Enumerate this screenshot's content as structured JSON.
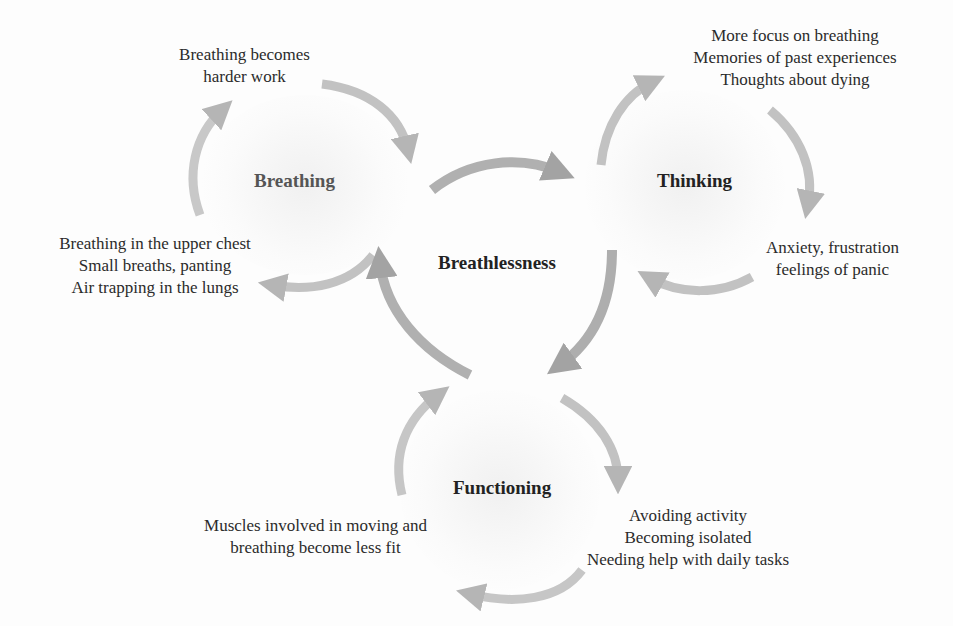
{
  "diagram": {
    "center": {
      "label": "Breathlessness"
    },
    "nodes": [
      {
        "id": "breathing",
        "label": "Breathing",
        "annotations": [
          {
            "lines": [
              "Breathing becomes",
              "harder work"
            ]
          },
          {
            "lines": [
              "Breathing in the upper chest",
              "Small breaths, panting",
              "Air trapping in the lungs"
            ]
          }
        ]
      },
      {
        "id": "thinking",
        "label": "Thinking",
        "annotations": [
          {
            "lines": [
              "More focus on breathing",
              "Memories of past experiences",
              "Thoughts about dying"
            ]
          },
          {
            "lines": [
              "Anxiety, frustration",
              "feelings of panic"
            ]
          }
        ]
      },
      {
        "id": "functioning",
        "label": "Functioning",
        "annotations": [
          {
            "lines": [
              "Avoiding activity",
              "Becoming isolated",
              "Needing help with daily tasks"
            ]
          },
          {
            "lines": [
              "Muscles involved in moving and",
              "breathing become less fit"
            ]
          }
        ]
      }
    ],
    "edges": [
      {
        "from": "breathlessness",
        "to": "thinking"
      },
      {
        "from": "breathlessness",
        "to": "functioning"
      },
      {
        "from": "functioning",
        "to": "breathlessness"
      }
    ],
    "colors": {
      "arrow": "#b9b9b9",
      "arrow_dark": "#a8a8a8",
      "text": "#2b2b2b",
      "hub_text": "#222222"
    }
  }
}
